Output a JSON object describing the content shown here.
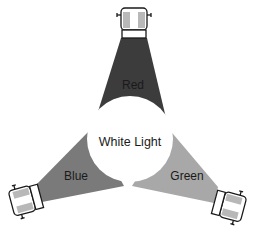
{
  "diagram": {
    "type": "additive-color-mixing",
    "center": {
      "label": "White Light",
      "fill": "#ffffff"
    },
    "beams": [
      {
        "id": "red",
        "label": "Red",
        "fill": "#3c3c3c"
      },
      {
        "id": "blue",
        "label": "Blue",
        "fill": "#7a7a7a"
      },
      {
        "id": "green",
        "label": "Green",
        "fill": "#a8a8a8"
      }
    ],
    "spotlights": [
      {
        "id": "top",
        "beam": "red"
      },
      {
        "id": "bottom-left",
        "beam": "blue"
      },
      {
        "id": "bottom-right",
        "beam": "green"
      }
    ],
    "colors": {
      "background": "#ffffff",
      "outline": "#1a1a1a",
      "lamp_band": "#b8b8b8"
    }
  }
}
